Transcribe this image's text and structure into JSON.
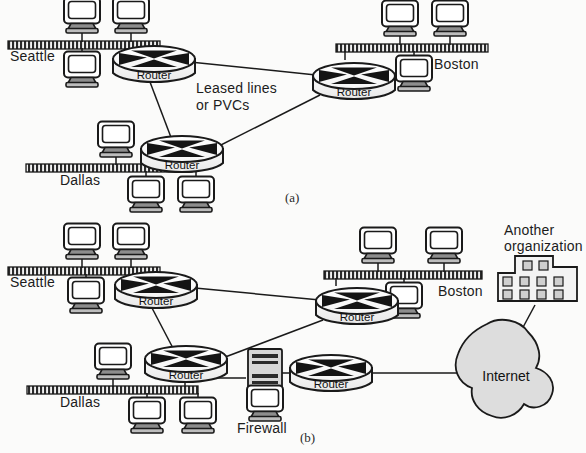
{
  "figure": {
    "background_color": "#fbfbfa",
    "line_color": "#1a1a1a",
    "fill_gray": "#d9d9d9"
  },
  "captions": {
    "a": "(a)",
    "b": "(b)"
  },
  "panel_a": {
    "site_labels": {
      "seattle": "Seattle",
      "boston": "Boston",
      "dallas": "Dallas"
    },
    "link_note_line1": "Leased lines",
    "link_note_line2": "or PVCs",
    "routers": [
      {
        "name": "router-seattle",
        "label": "Router"
      },
      {
        "name": "router-boston",
        "label": "Router"
      },
      {
        "name": "router-dallas",
        "label": "Router"
      }
    ],
    "workstation_count": 9,
    "lan_segments": 3
  },
  "panel_b": {
    "site_labels": {
      "seattle": "Seattle",
      "boston": "Boston",
      "dallas": "Dallas"
    },
    "firewall_label": "Firewall",
    "internet_label": "Internet",
    "another_org_line1": "Another",
    "another_org_line2": "organization",
    "routers": [
      {
        "name": "router-seattle",
        "label": "Router"
      },
      {
        "name": "router-boston",
        "label": "Router"
      },
      {
        "name": "router-dallas",
        "label": "Router"
      },
      {
        "name": "router-edge",
        "label": "Router"
      }
    ],
    "workstation_count": 9,
    "lan_segments": 3,
    "building_windows": 10
  },
  "icons": {
    "workstation": "computer-icon",
    "router": "router-cylinder-icon",
    "firewall": "firewall-server-icon",
    "internet": "cloud-icon",
    "building": "office-building-icon",
    "lan": "ethernet-bus-icon"
  }
}
